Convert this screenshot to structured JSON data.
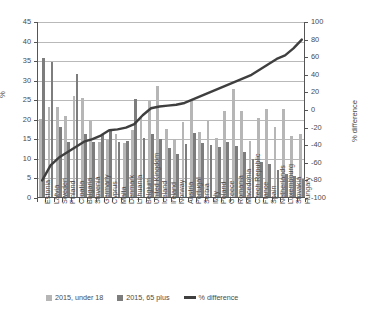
{
  "chart_data": {
    "type": "bar",
    "title": "",
    "xlabel": "",
    "ylabel": "%",
    "ylabel_secondary": "% difference",
    "ylim": [
      0,
      45
    ],
    "ylim_secondary": [
      -100,
      100
    ],
    "yticks": [
      0,
      5,
      10,
      15,
      20,
      25,
      30,
      35,
      40,
      45
    ],
    "yticks_secondary": [
      -100,
      -80,
      -60,
      -40,
      -20,
      0,
      20,
      40,
      60,
      80,
      100
    ],
    "grid": true,
    "legend_position": "bottom",
    "categories": [
      "Estonia",
      "Latvia",
      "Sweden",
      "Finland",
      "Croatia",
      "Bulgaria",
      "Slovenia",
      "Germany",
      "Cyprus",
      "Malta",
      "Denmark",
      "Lithuania",
      "Belgium",
      "United Kingdom",
      "Iceland",
      "Ireland",
      "Norway",
      "Austria",
      "Portugal",
      "Serbia",
      "Italy",
      "Poland",
      "Greece",
      "Romania",
      "Macedonia",
      "Czech Republic",
      "France",
      "Spain",
      "Netherlands",
      "Luxembourg",
      "Slovakia",
      "Hungary"
    ],
    "series": [
      {
        "name": "2015, under 18",
        "type": "bar",
        "color": "#b6b6b6",
        "axis": "left",
        "values": [
          20.0,
          23.0,
          22.9,
          20.7,
          25.9,
          25.3,
          19.4,
          14.1,
          14.7,
          16.2,
          13.9,
          17.2,
          20.6,
          24.6,
          28.5,
          17.5,
          14.9,
          19.3,
          24.7,
          16.7,
          19.4,
          15.2,
          22.0,
          27.5,
          22.1,
          14.4,
          20.3,
          22.4,
          17.9,
          22.5,
          15.5,
          16.0
        ]
      },
      {
        "name": "2015, 65 plus",
        "type": "bar",
        "color": "#7d7d7d",
        "axis": "left",
        "values": [
          35.5,
          34.5,
          18.0,
          14.0,
          31.5,
          16.0,
          14.0,
          16.2,
          17.2,
          14.0,
          14.4,
          25.0,
          15.0,
          16.0,
          14.8,
          12.5,
          11.1,
          13.6,
          16.3,
          13.9,
          13.4,
          12.7,
          14.1,
          13.0,
          11.5,
          9.8,
          9.0,
          8.5,
          7.0,
          6.0,
          5.5,
          4.5
        ]
      },
      {
        "name": "% difference",
        "type": "line",
        "color": "#3f3f3f",
        "axis": "right",
        "values": [
          -80,
          -63,
          -54,
          -48,
          -42,
          -36,
          -33,
          -29,
          -23,
          -22,
          -20,
          -16,
          -6,
          2,
          4,
          5,
          6,
          8,
          12,
          16,
          20,
          24,
          28,
          32,
          36,
          40,
          46,
          52,
          58,
          62,
          70,
          80
        ]
      }
    ]
  },
  "legend": {
    "items": [
      {
        "label": "2015, under 18",
        "swatch": "u18"
      },
      {
        "label": "2015, 65 plus",
        "swatch": "p65"
      },
      {
        "label": "% difference",
        "swatch": "line"
      }
    ]
  }
}
